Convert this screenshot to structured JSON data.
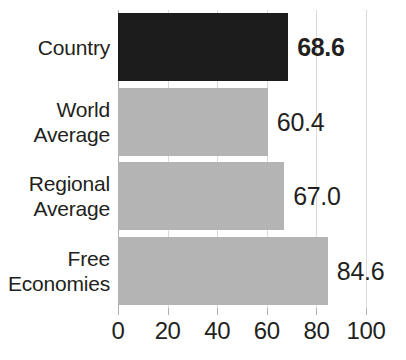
{
  "chart_data": {
    "type": "bar",
    "orientation": "horizontal",
    "title": "",
    "subtitle": "",
    "xlabel": "",
    "ylabel": "",
    "categories": [
      "Country",
      "World Average",
      "Regional Average",
      "Free Economies"
    ],
    "values": [
      68.6,
      60.4,
      67.0,
      84.6
    ],
    "value_labels": [
      "68.6",
      "60.4",
      "67.0",
      "84.6"
    ],
    "series": [
      {
        "name": "Score",
        "values": [
          68.6,
          60.4,
          67.0,
          84.6
        ]
      }
    ],
    "xlim": [
      0,
      100
    ],
    "xticks": [
      0,
      20,
      40,
      60,
      80,
      100
    ],
    "xtick_labels": [
      "0",
      "20",
      "40",
      "60",
      "80",
      "100"
    ],
    "grid": true,
    "grid_axis": "x",
    "legend": false,
    "legend_position": "none",
    "annotations": []
  },
  "bars": [
    {
      "label_lines": [
        "Country"
      ],
      "value": 68.6,
      "value_label": "68.6",
      "color": "#1c1c1c",
      "style": "dark",
      "emphasis": true
    },
    {
      "label_lines": [
        "World",
        "Average"
      ],
      "value": 60.4,
      "value_label": "60.4",
      "color": "#b4b4b4",
      "style": "light",
      "emphasis": false
    },
    {
      "label_lines": [
        "Regional",
        "Average"
      ],
      "value": 67.0,
      "value_label": "67.0",
      "color": "#b4b4b4",
      "style": "light",
      "emphasis": false
    },
    {
      "label_lines": [
        "Free",
        "Economies"
      ],
      "value": 84.6,
      "value_label": "84.6",
      "color": "#b4b4b4",
      "style": "light",
      "emphasis": false
    }
  ],
  "axis": {
    "ticks": [
      "0",
      "20",
      "40",
      "60",
      "80",
      "100"
    ],
    "tick_values": [
      0,
      20,
      40,
      60,
      80,
      100
    ]
  },
  "colors": {
    "highlight_bar": "#1c1c1c",
    "default_bar": "#b4b4b4",
    "gridline": "#d9d9d9",
    "axis_line": "#b0b0b0",
    "text": "#231f20",
    "background": "#ffffff"
  }
}
